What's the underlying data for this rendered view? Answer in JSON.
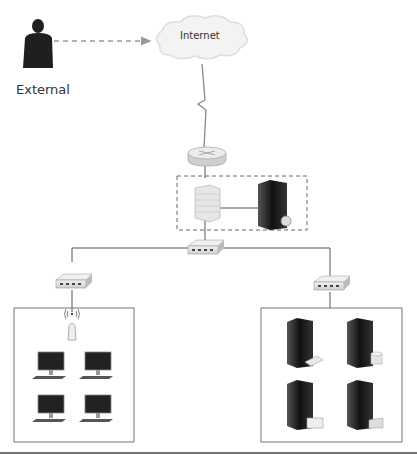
{
  "diagram": {
    "nodes": {
      "external": {
        "label": "External",
        "icon": "person-icon"
      },
      "internet": {
        "label": "Internet",
        "icon": "cloud-icon"
      },
      "router": {
        "icon": "router-icon"
      },
      "firewall": {
        "icon": "firewall-icon"
      },
      "dmz_server": {
        "icon": "server-icon"
      },
      "core_switch": {
        "icon": "switch-icon"
      },
      "left_switch": {
        "icon": "switch-icon"
      },
      "right_switch": {
        "icon": "switch-icon"
      },
      "access_point": {
        "icon": "wireless-access-point-icon"
      },
      "workstations": {
        "count": 4,
        "icon": "desktop-computer-icon"
      },
      "servers": {
        "count": 4,
        "icon": "server-icon"
      }
    },
    "colors": {
      "line": "#555555",
      "dashed_arrow": "#999999",
      "box_border": "#888888",
      "dark_device": "#1e1e1e",
      "light_device": "#e4e4e4"
    }
  }
}
